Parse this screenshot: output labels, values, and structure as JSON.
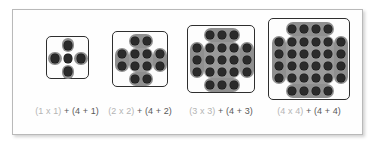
{
  "panel": {
    "background_color": "#fefefe",
    "border_color": "#b9b9b9"
  },
  "colors": {
    "dot": "#2b2b2b",
    "group": "#8f8f8f",
    "box_border": "#2e2e2e",
    "caption_light": "#b4b4b4",
    "caption_dark": "#585858"
  },
  "figures": [
    {
      "id": "figure-1",
      "n": 1,
      "center_grid": "1 x 1",
      "center_dots": 1,
      "side_group_dots": 1,
      "side_groups": 4,
      "total_dots": 5,
      "caption": {
        "square_part": "(1 x 1)",
        "rest_part": " + (4 + 1)",
        "full": "(1 x 1) + (4 + 1)"
      }
    },
    {
      "id": "figure-2",
      "n": 2,
      "center_grid": "2 x 2",
      "center_dots": 4,
      "side_group_dots": 2,
      "side_groups": 4,
      "total_dots": 12,
      "caption": {
        "square_part": "(2 x 2)",
        "rest_part": " + (4 + 2)",
        "full": "(2 x 2) + (4 + 2)"
      }
    },
    {
      "id": "figure-3",
      "n": 3,
      "center_grid": "3 x 3",
      "center_dots": 9,
      "side_group_dots": 3,
      "side_groups": 4,
      "total_dots": 21,
      "caption": {
        "square_part": "(3 x 3)",
        "rest_part": " + (4 + 3)",
        "full": "(3 x 3) + (4 + 3)"
      }
    },
    {
      "id": "figure-4",
      "n": 4,
      "center_grid": "4 x 4",
      "center_dots": 16,
      "side_group_dots": 4,
      "side_groups": 4,
      "total_dots": 32,
      "caption": {
        "square_part": "(4 x 4)",
        "rest_part": " + (4 + 4)",
        "full": "(4 x 4) + (4 + 4)"
      }
    }
  ]
}
